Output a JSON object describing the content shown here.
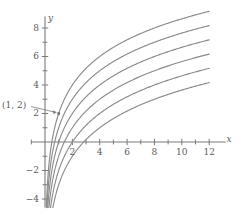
{
  "chart_data": {
    "type": "line",
    "title": "",
    "xlabel": "x",
    "ylabel": "y",
    "xlim": [
      -1,
      13.2
    ],
    "ylim": [
      -4.6,
      8.8
    ],
    "grid": false,
    "legend": "none",
    "x_ticks_major": [
      2,
      4,
      6,
      8,
      10,
      12
    ],
    "x_ticks_minor": [
      1,
      3,
      5,
      7,
      9,
      11
    ],
    "x_tick_labels": [
      "2",
      "4",
      "6",
      "8",
      "10",
      "12"
    ],
    "y_ticks_major": [
      -4,
      -2,
      2,
      4,
      6,
      8
    ],
    "y_ticks_minor": [
      -3,
      -1,
      1,
      3,
      5,
      7
    ],
    "y_tick_labels": [
      "−4",
      "−2",
      "2",
      "4",
      "6",
      "8"
    ],
    "curve_color": "#8a8a8a",
    "axis_color": "#7a7a7a",
    "text_color": "#5b5b5b",
    "series": [
      {
        "name": "y = 2 log2(x) + 2",
        "formula": "2*log2(x)+2",
        "offset": 2,
        "x_intercept": 0.5,
        "value_at_12": 8,
        "values": [
          {
            "x": 1,
            "y": 2
          },
          {
            "x": 2,
            "y": 4
          },
          {
            "x": 4,
            "y": 6
          },
          {
            "x": 8,
            "y": 8
          },
          {
            "x": 12,
            "y": 9.17
          }
        ]
      },
      {
        "name": "y = 2 log2(x) + 1",
        "formula": "2*log2(x)+1",
        "offset": 1,
        "x_intercept": 0.707,
        "value_at_12": 7,
        "values": [
          {
            "x": 1,
            "y": 1
          },
          {
            "x": 2,
            "y": 3
          },
          {
            "x": 4,
            "y": 5
          },
          {
            "x": 8,
            "y": 7
          },
          {
            "x": 12,
            "y": 8.17
          }
        ]
      },
      {
        "name": "y = 2 log2(x)",
        "formula": "2*log2(x)",
        "offset": 0,
        "x_intercept": 1,
        "value_at_12": 6,
        "values": [
          {
            "x": 1,
            "y": 0
          },
          {
            "x": 2,
            "y": 2
          },
          {
            "x": 4,
            "y": 4
          },
          {
            "x": 8,
            "y": 6
          },
          {
            "x": 12,
            "y": 7.17
          }
        ]
      },
      {
        "name": "y = 2 log2(x) − 1",
        "formula": "2*log2(x)-1",
        "offset": -1,
        "x_intercept": 1.414,
        "value_at_12": 5,
        "values": [
          {
            "x": 1,
            "y": -1
          },
          {
            "x": 2,
            "y": 1
          },
          {
            "x": 4,
            "y": 3
          },
          {
            "x": 8,
            "y": 5
          },
          {
            "x": 12,
            "y": 6.17
          }
        ]
      },
      {
        "name": "y = 2 log2(x) − 2",
        "formula": "2*log2(x)-2",
        "offset": -2,
        "x_intercept": 2,
        "value_at_12": 4,
        "values": [
          {
            "x": 1,
            "y": -2
          },
          {
            "x": 2,
            "y": 0
          },
          {
            "x": 4,
            "y": 2
          },
          {
            "x": 8,
            "y": 4
          },
          {
            "x": 12,
            "y": 5.17
          }
        ]
      },
      {
        "name": "y = 2 log2(x) − 3",
        "formula": "2*log2(x)-3",
        "offset": -3,
        "x_intercept": 2.828,
        "value_at_12": 3,
        "values": [
          {
            "x": 1,
            "y": -3
          },
          {
            "x": 2,
            "y": -1
          },
          {
            "x": 4,
            "y": 1
          },
          {
            "x": 8,
            "y": 3
          },
          {
            "x": 12,
            "y": 4.17
          }
        ]
      }
    ],
    "annotations": [
      {
        "label": "(1, 2)",
        "point": {
          "x": 1,
          "y": 2
        },
        "has_leader_line": true,
        "marker": "dot"
      }
    ]
  }
}
